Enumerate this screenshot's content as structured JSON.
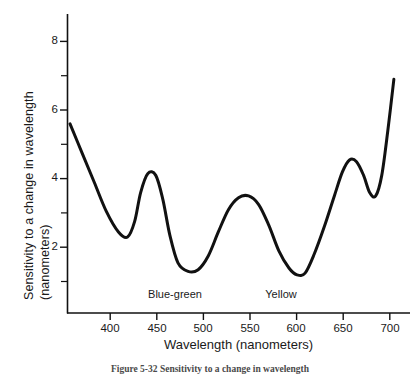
{
  "chart_data": {
    "type": "line",
    "title": "",
    "xlabel": "Wavelength  (nanometers)",
    "ylabel_line1": "Sensitivity to a change in wavelength",
    "ylabel_line2": "(nanometers)",
    "xlim": [
      370,
      710
    ],
    "ylim": [
      0,
      8.8
    ],
    "xticks": [
      400,
      450,
      500,
      550,
      600,
      650,
      700
    ],
    "xtick_labels": [
      "400",
      "450",
      "500",
      "550",
      "600",
      "650",
      "700"
    ],
    "yticks": [
      2,
      4,
      6,
      8
    ],
    "ytick_labels": [
      "2",
      "4",
      "6",
      "8"
    ],
    "yminor_ticks": [
      1,
      3,
      5,
      7
    ],
    "grid": false,
    "legend": "none",
    "series": [
      {
        "name": "Wavelength discrimination sensitivity",
        "color": "#111111",
        "x": [
          373,
          385,
          397,
          409,
          421,
          430,
          437,
          443,
          450,
          458,
          465,
          472,
          480,
          490,
          500,
          510,
          520,
          530,
          540,
          550,
          560,
          570,
          580,
          590,
          598,
          606,
          615,
          625,
          635,
          643,
          650,
          657,
          664,
          670,
          676,
          682,
          688,
          694
        ],
        "y": [
          5.6,
          4.75,
          3.9,
          3.05,
          2.45,
          2.3,
          2.75,
          3.6,
          4.15,
          4.1,
          3.4,
          2.35,
          1.55,
          1.3,
          1.35,
          1.75,
          2.45,
          3.1,
          3.45,
          3.5,
          3.25,
          2.65,
          1.9,
          1.4,
          1.2,
          1.25,
          1.8,
          2.6,
          3.5,
          4.2,
          4.55,
          4.5,
          4.1,
          3.6,
          3.5,
          4.1,
          5.4,
          6.9
        ]
      }
    ],
    "annotations": [
      {
        "text": "Blue-green",
        "x": 490,
        "y": 0.55
      },
      {
        "text": "Yellow",
        "x": 613,
        "y": 0.55
      }
    ]
  },
  "caption": {
    "text": "Figure 5-32  Sensitivity to a change in wavelength"
  }
}
